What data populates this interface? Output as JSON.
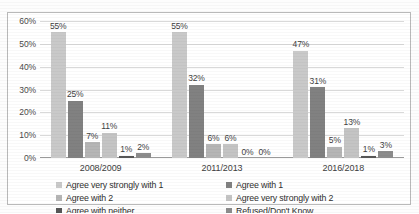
{
  "chart_data": {
    "type": "bar",
    "title": "",
    "subtitle": "",
    "xlabel": "",
    "ylabel": "",
    "categories": [
      "2008/2009",
      "2011/2013",
      "2016/2018"
    ],
    "ylim": [
      0,
      60
    ],
    "y_ticks": [
      "0%",
      "10%",
      "20%",
      "30%",
      "40%",
      "50%",
      "60%"
    ],
    "y_tick_values": [
      0,
      10,
      20,
      30,
      40,
      50,
      60
    ],
    "grid": true,
    "legend_position": "bottom",
    "series": [
      {
        "name": "Agree very strongly with 1",
        "color": "#c9c9c9",
        "values": [
          55,
          55,
          47
        ],
        "labels": [
          "55%",
          "55%",
          "47%"
        ]
      },
      {
        "name": "Agree with 1",
        "color": "#818181",
        "values": [
          25,
          32,
          31
        ],
        "labels": [
          "25%",
          "32%",
          "31%"
        ]
      },
      {
        "name": "Agree with 2",
        "color": "#b5b5b5",
        "values": [
          7,
          6,
          5
        ],
        "labels": [
          "7%",
          "6%",
          "5%"
        ]
      },
      {
        "name": "Agree very strongly with 2",
        "color": "#c4c4c4",
        "values": [
          11,
          6,
          13
        ],
        "labels": [
          "11%",
          "6%",
          "13%"
        ]
      },
      {
        "name": "Agree with neither",
        "color": "#565656",
        "values": [
          1,
          0,
          1
        ],
        "labels": [
          "1%",
          "0%",
          "1%"
        ]
      },
      {
        "name": "Refused/Don't Know",
        "color": "#8c8c8c",
        "values": [
          2,
          0,
          3
        ],
        "labels": [
          "2%",
          "0%",
          "3%"
        ]
      }
    ]
  },
  "legend": {
    "items": [
      {
        "label": "Agree very strongly with 1",
        "color": "#c9c9c9"
      },
      {
        "label": "Agree with 1",
        "color": "#818181"
      },
      {
        "label": "Agree with 2",
        "color": "#b5b5b5"
      },
      {
        "label": "Agree very strongly with 2",
        "color": "#c4c4c4"
      },
      {
        "label": "Agree with neither",
        "color": "#565656"
      },
      {
        "label": "Refused/Don't Know",
        "color": "#8c8c8c"
      }
    ]
  }
}
